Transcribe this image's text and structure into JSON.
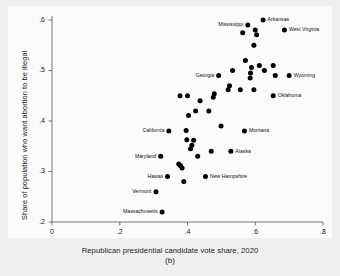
{
  "caption": "(b)",
  "chart_data": {
    "type": "scatter",
    "title": "",
    "xlabel": "Republican presidential candidate vote share, 2020",
    "ylabel": "Share of population who want abortion to be illegal",
    "xlim": [
      0,
      0.8
    ],
    "ylim": [
      0.2,
      0.6
    ],
    "xticks": [
      0,
      0.2,
      0.4,
      0.6,
      0.8
    ],
    "xtick_labels": [
      "0",
      ".2",
      ".4",
      ".6",
      ".8"
    ],
    "yticks": [
      0.2,
      0.3,
      0.4,
      0.5,
      0.6
    ],
    "ytick_labels": [
      ".2",
      ".3",
      ".4",
      ".5",
      ".6"
    ],
    "grid": false,
    "legend": "none",
    "marker": "filled-circle",
    "marker_color": "#000000",
    "points": [
      {
        "label": "Massachusetts",
        "x": 0.325,
        "y": 0.22,
        "label_pos": "left"
      },
      {
        "label": "Vermont",
        "x": 0.307,
        "y": 0.26,
        "label_pos": "left"
      },
      {
        "label": "Hawaii",
        "x": 0.341,
        "y": 0.29,
        "label_pos": "left"
      },
      {
        "label": "Maryland",
        "x": 0.321,
        "y": 0.33,
        "label_pos": "left"
      },
      {
        "label": "California",
        "x": 0.345,
        "y": 0.38,
        "label_pos": "left"
      },
      {
        "label": "New Hampshire",
        "x": 0.453,
        "y": 0.29,
        "label_pos": "right"
      },
      {
        "label": "Alaska",
        "x": 0.528,
        "y": 0.34,
        "label_pos": "right"
      },
      {
        "label": "Montana",
        "x": 0.568,
        "y": 0.38,
        "label_pos": "right"
      },
      {
        "label": "Georgia",
        "x": 0.492,
        "y": 0.49,
        "label_pos": "left"
      },
      {
        "label": "Oklahoma",
        "x": 0.653,
        "y": 0.45,
        "label_pos": "right"
      },
      {
        "label": "Wyoming",
        "x": 0.7,
        "y": 0.49,
        "label_pos": "right"
      },
      {
        "label": "Mississippi",
        "x": 0.578,
        "y": 0.59,
        "label_pos": "left"
      },
      {
        "label": "Arkansas",
        "x": 0.623,
        "y": 0.6,
        "label_pos": "right"
      },
      {
        "label": "West Virginia",
        "x": 0.686,
        "y": 0.58,
        "label_pos": "right"
      },
      {
        "label": "",
        "x": 0.389,
        "y": 0.28,
        "label_pos": "none"
      },
      {
        "label": "",
        "x": 0.374,
        "y": 0.315,
        "label_pos": "none"
      },
      {
        "label": "",
        "x": 0.379,
        "y": 0.312,
        "label_pos": "none"
      },
      {
        "label": "",
        "x": 0.384,
        "y": 0.307,
        "label_pos": "none"
      },
      {
        "label": "",
        "x": 0.43,
        "y": 0.33,
        "label_pos": "none"
      },
      {
        "label": "",
        "x": 0.47,
        "y": 0.34,
        "label_pos": "none"
      },
      {
        "label": "",
        "x": 0.409,
        "y": 0.345,
        "label_pos": "none"
      },
      {
        "label": "",
        "x": 0.413,
        "y": 0.352,
        "label_pos": "none"
      },
      {
        "label": "",
        "x": 0.398,
        "y": 0.363,
        "label_pos": "none"
      },
      {
        "label": "",
        "x": 0.418,
        "y": 0.362,
        "label_pos": "none"
      },
      {
        "label": "",
        "x": 0.396,
        "y": 0.381,
        "label_pos": "none"
      },
      {
        "label": "",
        "x": 0.499,
        "y": 0.39,
        "label_pos": "none"
      },
      {
        "label": "",
        "x": 0.403,
        "y": 0.411,
        "label_pos": "none"
      },
      {
        "label": "",
        "x": 0.424,
        "y": 0.42,
        "label_pos": "none"
      },
      {
        "label": "",
        "x": 0.463,
        "y": 0.42,
        "label_pos": "none"
      },
      {
        "label": "",
        "x": 0.437,
        "y": 0.44,
        "label_pos": "none"
      },
      {
        "label": "",
        "x": 0.378,
        "y": 0.45,
        "label_pos": "none"
      },
      {
        "label": "",
        "x": 0.4,
        "y": 0.45,
        "label_pos": "none"
      },
      {
        "label": "",
        "x": 0.476,
        "y": 0.447,
        "label_pos": "none"
      },
      {
        "label": "",
        "x": 0.479,
        "y": 0.454,
        "label_pos": "none"
      },
      {
        "label": "",
        "x": 0.52,
        "y": 0.462,
        "label_pos": "none"
      },
      {
        "label": "",
        "x": 0.524,
        "y": 0.47,
        "label_pos": "none"
      },
      {
        "label": "",
        "x": 0.556,
        "y": 0.462,
        "label_pos": "none"
      },
      {
        "label": "",
        "x": 0.596,
        "y": 0.462,
        "label_pos": "none"
      },
      {
        "label": "",
        "x": 0.533,
        "y": 0.5,
        "label_pos": "none"
      },
      {
        "label": "",
        "x": 0.571,
        "y": 0.52,
        "label_pos": "none"
      },
      {
        "label": "",
        "x": 0.585,
        "y": 0.485,
        "label_pos": "none"
      },
      {
        "label": "",
        "x": 0.586,
        "y": 0.495,
        "label_pos": "none"
      },
      {
        "label": "",
        "x": 0.589,
        "y": 0.506,
        "label_pos": "none"
      },
      {
        "label": "",
        "x": 0.612,
        "y": 0.51,
        "label_pos": "none"
      },
      {
        "label": "",
        "x": 0.627,
        "y": 0.5,
        "label_pos": "none"
      },
      {
        "label": "",
        "x": 0.653,
        "y": 0.51,
        "label_pos": "none"
      },
      {
        "label": "",
        "x": 0.659,
        "y": 0.49,
        "label_pos": "none"
      },
      {
        "label": "",
        "x": 0.596,
        "y": 0.55,
        "label_pos": "none"
      },
      {
        "label": "",
        "x": 0.563,
        "y": 0.575,
        "label_pos": "none"
      },
      {
        "label": "",
        "x": 0.6,
        "y": 0.58,
        "label_pos": "none"
      },
      {
        "label": "",
        "x": 0.604,
        "y": 0.571,
        "label_pos": "none"
      }
    ]
  }
}
